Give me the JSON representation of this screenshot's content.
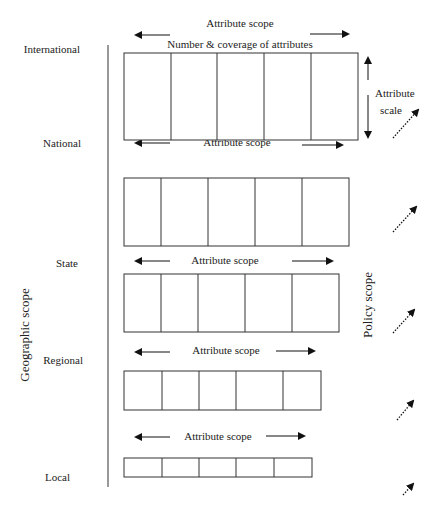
{
  "diagram": {
    "axis_labels": {
      "geographic_scope": "Geographic scope",
      "policy_scope": "Policy scope"
    },
    "header": {
      "attribute_scope": "Attribute scope",
      "number_coverage": "Number & coverage of attributes",
      "attribute_scale_line1": "Attribute",
      "attribute_scale_line2": "scale"
    },
    "levels": [
      {
        "name": "International",
        "scope_label": "Attribute scope",
        "cells": 5
      },
      {
        "name": "National",
        "scope_label": "Attribute scope",
        "cells": 5
      },
      {
        "name": "State",
        "scope_label": "Attribute scope",
        "cells": 5
      },
      {
        "name": "Regional",
        "scope_label": "Attribute scope",
        "cells": 5
      },
      {
        "name": "Local",
        "scope_label": "",
        "cells": 5
      }
    ]
  }
}
